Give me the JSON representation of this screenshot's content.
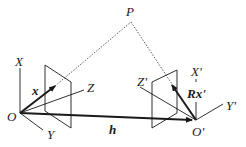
{
  "diagram": {
    "type": "epipolar-geometry",
    "labels": {
      "point": "P",
      "origin_left": "O",
      "origin_right": "O'",
      "left_x_axis": "X",
      "left_y_axis": "Y",
      "left_z_axis": "Z",
      "right_x_axis": "X'",
      "right_y_axis": "Y'",
      "right_z_axis": "Z'",
      "left_vector": "x",
      "right_vector": "Rx'",
      "baseline": "h"
    },
    "colors": {
      "stroke": "#1a1a1a",
      "background": "#ffffff"
    }
  }
}
